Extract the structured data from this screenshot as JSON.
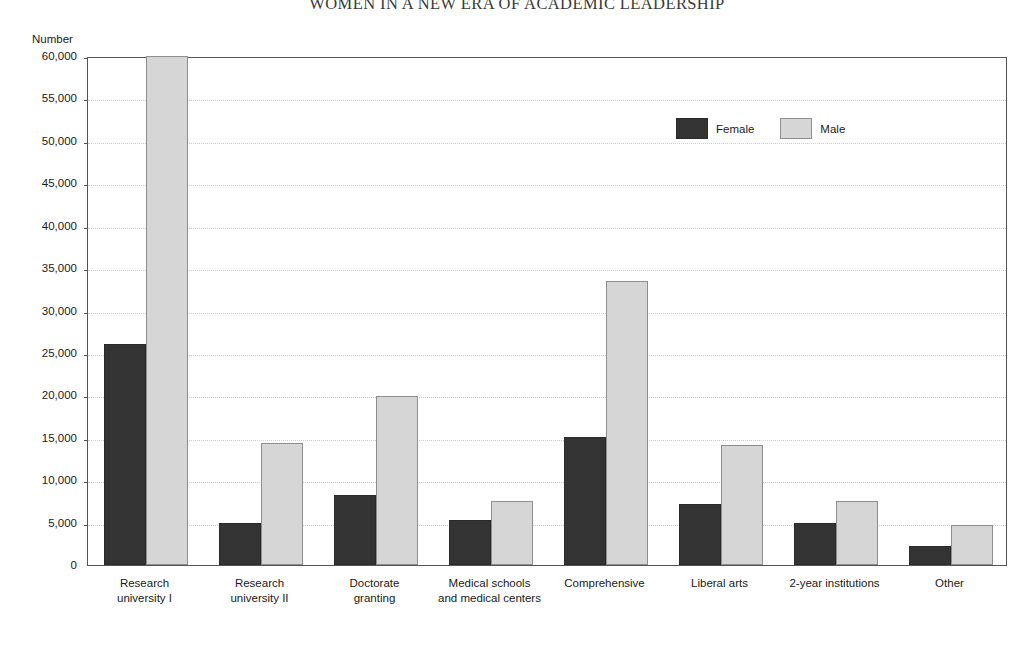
{
  "page": {
    "running_head": "WOMEN IN A NEW ERA OF ACADEMIC LEADERSHIP"
  },
  "chart_data": {
    "type": "bar",
    "title": "",
    "xlabel": "",
    "ylabel": "Number",
    "ylim": [
      0,
      60000
    ],
    "yticks": [
      "0",
      "5,000",
      "10,000",
      "15,000",
      "20,000",
      "25,000",
      "30,000",
      "35,000",
      "40,000",
      "45,000",
      "50,000",
      "55,000",
      "60,000"
    ],
    "ytick_values": [
      0,
      5000,
      10000,
      15000,
      20000,
      25000,
      30000,
      35000,
      40000,
      45000,
      50000,
      55000,
      60000
    ],
    "grid": true,
    "legend_position": "upper-center-right",
    "categories": [
      "Research\nuniversity I",
      "Research\nuniversity II",
      "Doctorate\ngranting",
      "Medical schools\nand medical centers",
      "Comprehensive",
      "Liberal arts",
      "2-year institutions",
      "Other"
    ],
    "category_lines": [
      [
        "Research",
        "university I"
      ],
      [
        "Research",
        "university II"
      ],
      [
        "Doctorate",
        "granting"
      ],
      [
        "Medical schools",
        "and medical centers"
      ],
      [
        "Comprehensive"
      ],
      [
        "Liberal arts"
      ],
      [
        "2-year institutions"
      ],
      [
        "Other"
      ]
    ],
    "series": [
      {
        "name": "Female",
        "color": "#333333",
        "values": [
          26000,
          5000,
          8300,
          5300,
          15100,
          7200,
          5000,
          2200
        ]
      },
      {
        "name": "Male",
        "color": "#d6d6d6",
        "values": [
          60000,
          14400,
          19900,
          7500,
          33500,
          14100,
          7500,
          4700
        ]
      }
    ]
  },
  "legend": {
    "items": [
      {
        "label": "Female",
        "swatch": "female"
      },
      {
        "label": "Male",
        "swatch": "male"
      }
    ]
  }
}
